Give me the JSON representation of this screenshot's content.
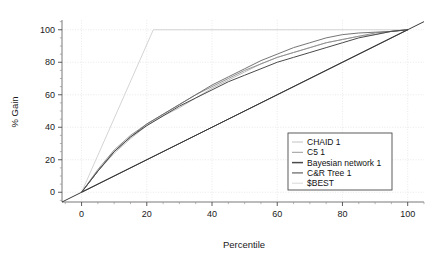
{
  "chart_data": {
    "type": "line",
    "title": "",
    "xlabel": "Percentile",
    "ylabel": "% Gain",
    "xlim": [
      -6,
      105
    ],
    "ylim": [
      -6,
      106
    ],
    "xticks": [
      0,
      20,
      40,
      60,
      80,
      100
    ],
    "yticks": [
      0,
      20,
      40,
      60,
      80,
      100
    ],
    "grid": true,
    "legend_position": "lower-right",
    "series": [
      {
        "name": "CHAID 1",
        "color": "#b9b9b9",
        "x": [
          0,
          5,
          10,
          15,
          20,
          25,
          30,
          35,
          40,
          45,
          50,
          55,
          60,
          65,
          70,
          75,
          80,
          85,
          90,
          95,
          100
        ],
        "y": [
          0,
          13,
          24,
          33,
          41,
          47,
          52,
          58,
          64,
          69,
          74,
          79,
          83,
          86,
          89,
          92,
          94,
          96,
          97,
          99,
          100
        ]
      },
      {
        "name": "C5 1",
        "color": "#8d8d8d",
        "x": [
          0,
          5,
          10,
          15,
          20,
          25,
          30,
          35,
          40,
          45,
          50,
          55,
          60,
          65,
          70,
          75,
          80,
          85,
          90,
          95,
          100
        ],
        "y": [
          0,
          14,
          26,
          35,
          42,
          48,
          54,
          60,
          65,
          70,
          75,
          79,
          83,
          86,
          89,
          92,
          94,
          96,
          98,
          99,
          100
        ]
      },
      {
        "name": "Bayesian network 1",
        "color": "#4a4a4a",
        "x": [
          0,
          5,
          10,
          15,
          20,
          25,
          30,
          35,
          40,
          45,
          50,
          55,
          60,
          65,
          70,
          75,
          80,
          85,
          90,
          95,
          100
        ],
        "y": [
          0,
          13,
          25,
          34,
          41,
          47,
          53,
          58,
          63,
          68,
          72,
          76,
          80,
          83,
          86,
          89,
          92,
          95,
          97,
          99,
          100
        ]
      },
      {
        "name": "C&R Tree 1",
        "color": "#6e6e6e",
        "x": [
          0,
          5,
          10,
          15,
          20,
          25,
          30,
          35,
          40,
          45,
          50,
          55,
          60,
          65,
          70,
          75,
          80,
          85,
          90,
          95,
          100
        ],
        "y": [
          0,
          13,
          25,
          34,
          42,
          48,
          54,
          60,
          66,
          71,
          76,
          81,
          85,
          89,
          92,
          95,
          97,
          98,
          98.5,
          99,
          100
        ]
      },
      {
        "name": "$BEST",
        "color": "#d2d2d2",
        "x": [
          0,
          22,
          100
        ],
        "y": [
          0,
          100,
          100
        ]
      },
      {
        "name": "baseline",
        "color": "#3a3a3a",
        "x": [
          0,
          100
        ],
        "y": [
          0,
          100
        ]
      }
    ],
    "legend_entries": [
      {
        "label": "CHAID 1",
        "color": "#c2c2c2"
      },
      {
        "label": "C5 1",
        "color": "#9a9a9a"
      },
      {
        "label": "Bayesian network 1",
        "color": "#4a4a4a"
      },
      {
        "label": "C&R Tree 1",
        "color": "#6e6e6e"
      },
      {
        "label": "$BEST",
        "color": "#d8d8d8"
      }
    ],
    "xtick_labels": [
      "0",
      "20",
      "40",
      "60",
      "80",
      "100"
    ],
    "ytick_labels": [
      "0",
      "20",
      "40",
      "60",
      "80",
      "100"
    ]
  }
}
